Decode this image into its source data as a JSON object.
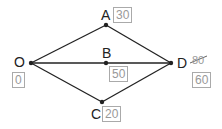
{
  "diagram": {
    "type": "network-graph",
    "nodes": [
      {
        "id": "O",
        "label": "O",
        "value": "0"
      },
      {
        "id": "A",
        "label": "A",
        "value": "30"
      },
      {
        "id": "B",
        "label": "B",
        "value": "50"
      },
      {
        "id": "C",
        "label": "C",
        "value": "20"
      },
      {
        "id": "D",
        "label": "D",
        "value": "60",
        "struck_value": "80"
      }
    ],
    "edges": [
      {
        "from": "O",
        "to": "A"
      },
      {
        "from": "O",
        "to": "B"
      },
      {
        "from": "O",
        "to": "C"
      },
      {
        "from": "A",
        "to": "D"
      },
      {
        "from": "B",
        "to": "D"
      },
      {
        "from": "C",
        "to": "D"
      }
    ],
    "colors": {
      "line": "#222222",
      "box_border": "#aaaaaa",
      "box_text": "#999999"
    }
  }
}
